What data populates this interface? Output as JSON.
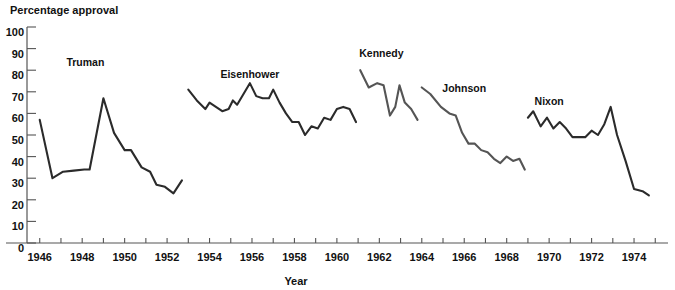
{
  "chart_data": {
    "type": "line",
    "title": "",
    "ylabel": "Percentage approval",
    "xlabel": "Year",
    "ylim": [
      0,
      100
    ],
    "xlim": [
      1945.4,
      1975.6
    ],
    "ytick_labels": [
      "100",
      "90",
      "80",
      "70",
      "60",
      "50",
      "40",
      "30",
      "20",
      "10",
      "0"
    ],
    "yticks": [
      100,
      90,
      80,
      70,
      60,
      50,
      40,
      30,
      20,
      10,
      0
    ],
    "xtick_labels": [
      "1946",
      "1948",
      "1950",
      "1952",
      "1954",
      "1956",
      "1958",
      "1960",
      "1962",
      "1964",
      "1966",
      "1968",
      "1970",
      "1972",
      "1974"
    ],
    "xticks": [
      1946,
      1948,
      1950,
      1952,
      1954,
      1956,
      1958,
      1960,
      1962,
      1964,
      1966,
      1968,
      1970,
      1972,
      1974
    ],
    "xticks_minor": [
      1947,
      1949,
      1951,
      1953,
      1955,
      1957,
      1959,
      1961,
      1963,
      1965,
      1967,
      1969,
      1971,
      1973,
      1975
    ],
    "grid": false,
    "legend": "inline-labels",
    "series": [
      {
        "name": "Truman",
        "color": "#2b2b2b",
        "label_x": 1948.15,
        "label_y": 82.0,
        "x": [
          1946.0,
          1946.6,
          1947.1,
          1947.6,
          1948.1,
          1948.35,
          1949.0,
          1949.5,
          1950.0,
          1950.3,
          1950.8,
          1951.2,
          1951.5,
          1951.9,
          1952.3,
          1952.7
        ],
        "y": [
          57,
          30,
          33,
          33.5,
          34,
          34,
          67,
          51,
          43,
          43,
          35,
          33,
          27,
          26,
          23,
          29
        ]
      },
      {
        "name": "Eisenhower",
        "color": "#2b2b2b",
        "label_x": 1955.9,
        "label_y": 76.5,
        "x": [
          1953.0,
          1953.4,
          1953.8,
          1954.0,
          1954.3,
          1954.6,
          1954.9,
          1955.1,
          1955.3,
          1955.6,
          1955.9,
          1956.2,
          1956.5,
          1956.8,
          1957.0,
          1957.3,
          1957.6,
          1957.9,
          1958.2,
          1958.5,
          1958.8,
          1959.1,
          1959.4,
          1959.7,
          1960.0,
          1960.3,
          1960.6,
          1960.9
        ],
        "y": [
          71,
          66,
          62,
          65,
          63,
          61,
          62,
          66,
          64,
          69,
          74,
          68,
          67,
          67,
          71,
          65,
          60,
          56,
          56,
          50,
          54,
          53,
          58,
          57,
          62,
          63,
          62,
          56
        ]
      },
      {
        "name": "Kennedy",
        "color": "#555555",
        "label_x": 1962.1,
        "label_y": 86.0,
        "x": [
          1961.1,
          1961.5,
          1961.9,
          1962.2,
          1962.5,
          1962.75,
          1962.95,
          1963.2,
          1963.5,
          1963.8
        ],
        "y": [
          80,
          72,
          74,
          73,
          59,
          63,
          73,
          65,
          62,
          57
        ]
      },
      {
        "name": "Johnson",
        "color": "#555555",
        "label_x": 1966.0,
        "label_y": 70.0,
        "x": [
          1964.0,
          1964.4,
          1964.9,
          1965.3,
          1965.6,
          1965.9,
          1966.2,
          1966.5,
          1966.8,
          1967.1,
          1967.4,
          1967.7,
          1968.0,
          1968.3,
          1968.6,
          1968.85
        ],
        "y": [
          72,
          69,
          63,
          60,
          59,
          51,
          46,
          46,
          43,
          42,
          39,
          37,
          40,
          38,
          39,
          34
        ]
      },
      {
        "name": "Nixon",
        "color": "#2b2b2b",
        "label_x": 1970.0,
        "label_y": 64.0,
        "x": [
          1969.0,
          1969.25,
          1969.6,
          1969.9,
          1970.2,
          1970.5,
          1970.8,
          1971.1,
          1971.4,
          1971.7,
          1972.0,
          1972.3,
          1972.6,
          1972.9,
          1973.2,
          1973.6,
          1974.0,
          1974.4,
          1974.7
        ],
        "y": [
          58,
          61,
          54,
          58,
          53,
          56,
          53,
          49,
          49,
          49,
          52,
          50,
          55,
          63,
          50,
          38,
          25,
          24,
          22
        ]
      }
    ]
  },
  "axis": {
    "y_title": "Percentage approval",
    "x_title": "Year"
  }
}
